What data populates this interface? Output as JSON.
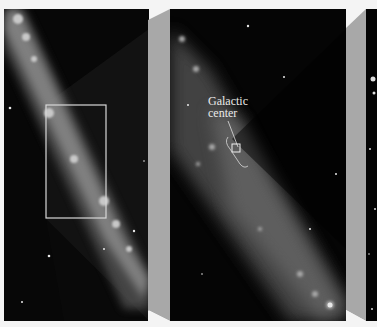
{
  "figure": {
    "panels": [
      {
        "id": "wide-field",
        "description": "Milky Way band diagonal, inset rectangle marking zoom region"
      },
      {
        "id": "zoomed-field",
        "description": "Zoomed view of galactic center region"
      },
      {
        "id": "narrow-field",
        "description": "Further zoomed star field (cropped)"
      }
    ],
    "annotation": {
      "line1": "Galactic",
      "line2": "center"
    },
    "colors": {
      "background": "#f4f4f4",
      "sky": "#060606",
      "band": "#9a9a9a",
      "connector": "#a8a8a8",
      "inset_border": "#d8d8d8"
    }
  }
}
